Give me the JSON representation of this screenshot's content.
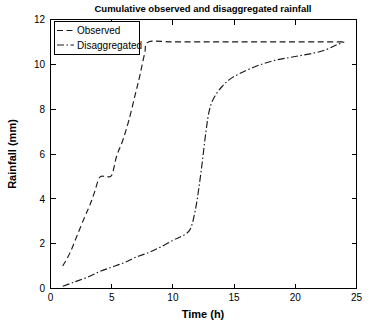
{
  "chart_data": {
    "type": "line",
    "title": "Cumulative observed and disaggregated rainfall",
    "xlabel": "Time (h)",
    "ylabel": "Rainfall (mm)",
    "xlim": [
      0,
      25
    ],
    "ylim": [
      0,
      12
    ],
    "xticks": [
      0,
      5,
      10,
      15,
      20,
      25
    ],
    "yticks": [
      0,
      2,
      4,
      6,
      8,
      10,
      12
    ],
    "xtick_labels": [
      "0",
      "5",
      "10",
      "15",
      "20",
      "25"
    ],
    "ytick_labels": [
      "0",
      "2",
      "4",
      "6",
      "8",
      "10",
      "12"
    ],
    "grid": false,
    "legend_position": "top-left",
    "series": [
      {
        "name": "Observed",
        "line_style": "dashed",
        "color": "#1a1a1a",
        "x": [
          1,
          1.6,
          2.2,
          2.8,
          3.2,
          3.6,
          4.0,
          4.5,
          5.0,
          5.4,
          5.9,
          6.4,
          6.9,
          7.3,
          7.7,
          8.0,
          10,
          13,
          16,
          19,
          22,
          24
        ],
        "y": [
          1.0,
          1.6,
          2.4,
          3.2,
          3.7,
          4.3,
          4.95,
          5.0,
          5.05,
          5.9,
          6.6,
          7.5,
          8.6,
          9.5,
          10.5,
          11.0,
          11.0,
          11.0,
          11.0,
          11.0,
          11.0,
          11.0
        ]
      },
      {
        "name": "Disaggregated",
        "line_style": "dashdot",
        "color": "#1a1a1a",
        "x": [
          1,
          2,
          3,
          4,
          5,
          6,
          7,
          8,
          9,
          10,
          10.6,
          11.1,
          11.5,
          11.9,
          12.3,
          12.7,
          13.0,
          13.4,
          14.0,
          14.7,
          15.5,
          16.5,
          17.5,
          18.5,
          19.5,
          20.5,
          21.5,
          22.5,
          23.3,
          24.0
        ],
        "y": [
          0.1,
          0.3,
          0.5,
          0.75,
          0.95,
          1.15,
          1.4,
          1.6,
          1.85,
          2.15,
          2.3,
          2.45,
          2.75,
          3.7,
          5.2,
          7.0,
          8.0,
          8.55,
          9.0,
          9.35,
          9.6,
          9.85,
          10.05,
          10.2,
          10.3,
          10.4,
          10.5,
          10.65,
          10.85,
          11.0
        ]
      }
    ],
    "annotations": []
  },
  "legend": {
    "items": [
      {
        "label": "Observed",
        "style": "dashed"
      },
      {
        "label": "Disaggregated",
        "style": "dashdot"
      }
    ]
  },
  "colors": {
    "background": "#ffffff",
    "axis": "#000000",
    "line": "#1a1a1a"
  }
}
